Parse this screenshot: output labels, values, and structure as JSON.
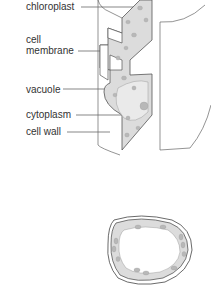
{
  "labels": {
    "chloroplast": "chloroplast",
    "cell_membrane_line1": "cell",
    "cell_membrane_line2": "membrane",
    "vacuole": "vacuole",
    "cytoplasm": "cytoplasm",
    "cell_wall": "cell wall"
  },
  "colors": {
    "line": "#555555",
    "cytoplasm_fill": "#dcdcdc",
    "chloroplast_fill": "#b8b8b8"
  }
}
